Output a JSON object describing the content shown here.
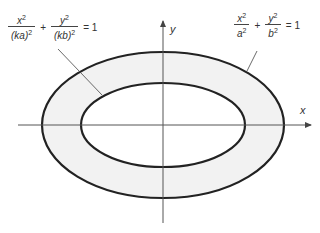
{
  "diagram": {
    "title": "",
    "axes": {
      "x_label": "x",
      "y_label": "y"
    },
    "outer_ellipse": {
      "label": "x²/a² + y²/b² = 1",
      "num1": "x",
      "den1": "a",
      "num2": "y",
      "den2": "b",
      "exp": "2",
      "plus": "+",
      "equals": "= 1"
    },
    "inner_ellipse": {
      "label": "x²/(ka)² + y²/(kb)² = 1",
      "num1": "x",
      "den1": "(ka)",
      "num2": "y",
      "den2": "(kb)",
      "exp": "2",
      "plus": "+",
      "equals": "= 1"
    },
    "colors": {
      "stroke": "#222222",
      "ring_fill": "#f2f2f2",
      "axis": "#555555"
    }
  }
}
